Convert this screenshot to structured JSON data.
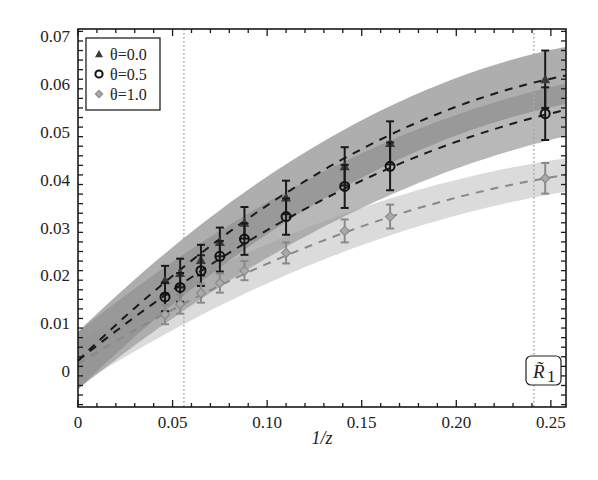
{
  "chart_data": {
    "type": "line",
    "title": "",
    "xlabel": "1/z",
    "ylabel": "",
    "xlim": [
      0,
      0.258
    ],
    "ylim": [
      -0.0075,
      0.0715
    ],
    "grid": false,
    "legend_position": "upper left",
    "x_ticks": [
      0,
      0.05,
      0.1,
      0.15,
      0.2,
      0.25
    ],
    "x_tick_labels": [
      "0",
      "0.05",
      "0.10",
      "0.15",
      "0.20",
      "0.25"
    ],
    "y_ticks": [
      0,
      0.01,
      0.02,
      0.03,
      0.04,
      0.05,
      0.06,
      0.07
    ],
    "y_tick_labels": [
      "0",
      "0.01",
      "0.02",
      "0.03",
      "0.04",
      "0.05",
      "0.06",
      "0.07"
    ],
    "vertical_dotted_lines": [
      0.056,
      0.241
    ],
    "annotation": "R̃1",
    "x": [
      0.046,
      0.054,
      0.065,
      0.075,
      0.088,
      0.11,
      0.141,
      0.165,
      0.247
    ],
    "series": [
      {
        "name": "θ=0.0",
        "marker": "triangle",
        "color": "#3a3a3a",
        "band_color": "#8c8c8c",
        "values": [
          0.019,
          0.0205,
          0.0232,
          0.027,
          0.031,
          0.0363,
          0.0428,
          0.0477,
          0.061
        ],
        "errors": [
          0.003,
          0.003,
          0.0032,
          0.003,
          0.0033,
          0.0035,
          0.004,
          0.0045,
          0.006
        ],
        "fit": {
          "y0": 0.0022,
          "y_end": 0.0618,
          "curvature": -0.33
        },
        "band_halfwidth": {
          "start": 0.006,
          "end": 0.006
        }
      },
      {
        "name": "θ=0.5",
        "marker": "circle",
        "color": "#111111",
        "band_color": "#9a9a9a",
        "values": [
          0.0155,
          0.0175,
          0.021,
          0.024,
          0.0276,
          0.0323,
          0.0386,
          0.0428,
          0.0538
        ],
        "errors": [
          0.003,
          0.003,
          0.0032,
          0.0032,
          0.0033,
          0.0038,
          0.0045,
          0.005,
          0.0055
        ],
        "fit": {
          "y0": 0.0022,
          "y_end": 0.0546,
          "curvature": -0.28
        },
        "band_halfwidth": {
          "start": 0.006,
          "end": 0.0055
        }
      },
      {
        "name": "θ=1.0",
        "marker": "diamond",
        "color": "#8a8a8a",
        "band_color": "#cfcfcf",
        "values": [
          0.0118,
          0.014,
          0.0163,
          0.0184,
          0.021,
          0.0247,
          0.0293,
          0.0323,
          0.0403
        ],
        "errors": [
          0.002,
          0.002,
          0.002,
          0.002,
          0.002,
          0.0022,
          0.0024,
          0.0025,
          0.0032
        ],
        "fit": {
          "y0": 0.0015,
          "y_end": 0.041,
          "curvature": -0.3
        },
        "band_halfwidth": {
          "start": 0.0045,
          "end": 0.0035
        }
      }
    ]
  },
  "legend": {
    "items": [
      {
        "label": "θ=0.0",
        "marker": "triangle",
        "color": "#3a3a3a"
      },
      {
        "label": "θ=0.5",
        "marker": "circle",
        "color": "#111111"
      },
      {
        "label": "θ=1.0",
        "marker": "diamond",
        "color": "#8a8a8a"
      }
    ]
  },
  "axes": {
    "x_title": "1/z",
    "annotation_label": "R̃",
    "annotation_sub": "1"
  }
}
